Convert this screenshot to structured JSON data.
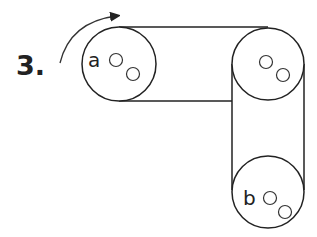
{
  "problem": {
    "number": "3.",
    "pulleys": [
      {
        "label": "a",
        "position": "left"
      },
      {
        "label": "",
        "position": "top-right"
      },
      {
        "label": "b",
        "position": "bottom-right"
      }
    ],
    "arrow": "clockwise rotation on pulley a",
    "colors": {
      "stroke": "#222222",
      "background": "#ffffff"
    }
  }
}
